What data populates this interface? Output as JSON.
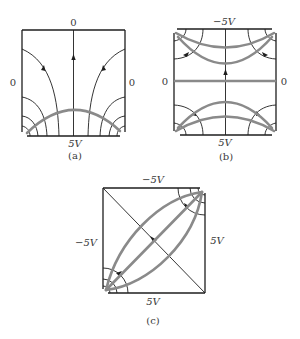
{
  "figure": {
    "panels": [
      {
        "id": "a",
        "caption": "(a)",
        "labels": {
          "top": "0",
          "left": "0",
          "right": "0",
          "bottom": "5V"
        }
      },
      {
        "id": "b",
        "caption": "(b)",
        "labels": {
          "top": "−5V",
          "left": "0",
          "right": "0",
          "bottom": "5V"
        }
      },
      {
        "id": "c",
        "caption": "(c)",
        "labels": {
          "top": "−5V",
          "left": "−5V",
          "right": "5V",
          "bottom": "5V"
        }
      }
    ],
    "legend": {
      "field_line_color": "#1e1e1e",
      "equipotential_color": "#8a8a8a"
    }
  }
}
